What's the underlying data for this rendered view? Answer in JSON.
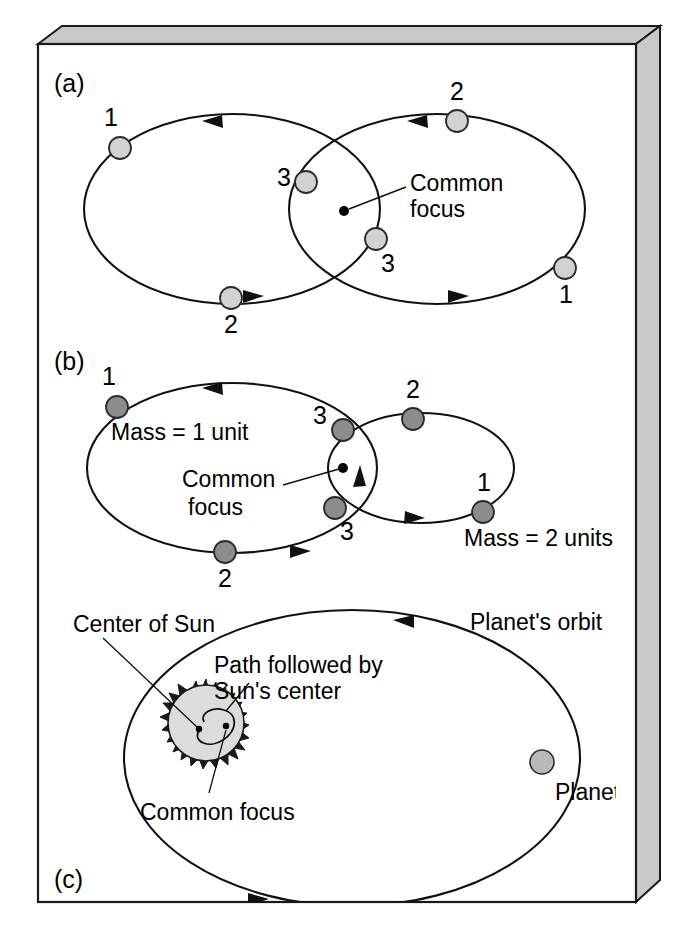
{
  "figure": {
    "background_color": "#ffffff",
    "frame_bevel_color": "#c9c9c9",
    "line_color": "#111111"
  },
  "panels": [
    {
      "id": "a",
      "letter": "(a)",
      "description": "Two equal-mass bodies on congruent elliptical orbits about a common focus",
      "ball_color": "#d2d2d2",
      "annotations": [
        {
          "name": "common-focus",
          "text_line1": "Common",
          "text_line2": "focus"
        }
      ],
      "position_labels": [
        "1",
        "2",
        "3",
        "1",
        "2",
        "3"
      ]
    },
    {
      "id": "b",
      "letter": "(b)",
      "description": "Unequal masses: the lighter body traces the larger ellipse",
      "ball_color": "#8c8c8c",
      "annotations": [
        {
          "name": "mass-1-label",
          "text": "Mass = 1 unit"
        },
        {
          "name": "mass-2-label",
          "text": "Mass = 2 units"
        },
        {
          "name": "common-focus",
          "text_line1": "Common",
          "text_line2": "focus"
        }
      ],
      "position_labels": [
        "1",
        "2",
        "3",
        "1",
        "2",
        "3"
      ]
    },
    {
      "id": "c",
      "letter": "(c)",
      "description": "Sun and planet orbiting their common focus, which lies inside the Sun",
      "ball_color": "#b9b9b9",
      "annotations": [
        {
          "name": "center-of-sun",
          "text": "Center of Sun"
        },
        {
          "name": "sun-path",
          "text_line1": "Path followed by",
          "text_line2": "Sun's center"
        },
        {
          "name": "common-focus",
          "text": "Common focus"
        },
        {
          "name": "planet-orbit",
          "text": "Planet's orbit"
        },
        {
          "name": "planet",
          "text": "Planet"
        }
      ]
    }
  ],
  "labels": {
    "panel_a_letter": "(a)",
    "panel_b_letter": "(b)",
    "panel_c_letter": "(c)",
    "n1": "1",
    "n2": "2",
    "n3": "3",
    "a_common_focus_l1": "Common",
    "a_common_focus_l2": "focus",
    "b_common_focus_l1": "Common",
    "b_common_focus_l2": "focus",
    "b_mass1": "Mass = 1 unit",
    "b_mass2": "Mass = 2 units",
    "c_center_of_sun": "Center of Sun",
    "c_path_l1": "Path followed by",
    "c_path_l2": "Sun's center",
    "c_common_focus": "Common focus",
    "c_planet_orbit": "Planet's orbit",
    "c_planet": "Planet"
  }
}
